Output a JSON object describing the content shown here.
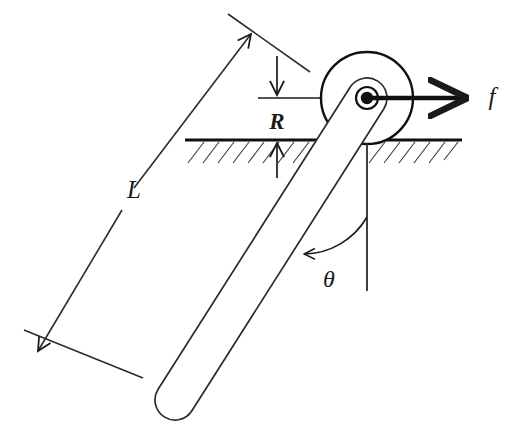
{
  "figure": {
    "background_color": "#ffffff",
    "stroke_color": "#1a1a1a",
    "width": 529,
    "height": 437
  },
  "labels": {
    "length": "L",
    "radius": "R",
    "force": "f",
    "angle": "θ"
  },
  "elements": {
    "wheel": {
      "name": "wheel-circle",
      "cx": 367,
      "cy": 98,
      "r": 46
    },
    "hub_outer": {
      "name": "hub-outer-ring",
      "cx": 367,
      "cy": 98,
      "r": 11
    },
    "hub_inner": {
      "name": "hub-center-dot",
      "cx": 367,
      "cy": 98,
      "r": 6
    },
    "rod": {
      "name": "inclined-rod",
      "top_x": 367,
      "top_y": 98,
      "bottom_x": 175,
      "bottom_y": 400,
      "half_width": 20
    },
    "ground": {
      "name": "ground-line",
      "x1": 185,
      "x2": 462,
      "y": 140
    },
    "centerline": {
      "name": "wheel-centerline",
      "x1": 258,
      "x2": 432,
      "y": 98
    },
    "force_arrow": {
      "name": "force-arrow",
      "x1": 367,
      "x2": 480,
      "y": 98
    },
    "vertical_ref": {
      "name": "vertical-reference-line",
      "x": 367,
      "y1": 143,
      "y2": 291
    },
    "angle_arc": {
      "name": "angle-arc",
      "cx": 367,
      "cy": 291,
      "radius": 74,
      "from_deg": 270,
      "to_deg": 212
    },
    "dimension_L": {
      "name": "length-dimension-line",
      "x1": 248,
      "y1": 32,
      "x2": 40,
      "y2": 353,
      "label_x": 134,
      "label_y": 194
    },
    "dimension_R": {
      "name": "radius-dimension",
      "x": 277,
      "top_y": 58,
      "mid_y": 98,
      "bottom_y": 140,
      "bottom_end_y": 175,
      "label_x": 277,
      "label_y": 128
    }
  },
  "annotations": {
    "L_description": "Rod length dimension with arrows at both ends",
    "R_description": "Wheel radius dimension between centerline and ground",
    "f_description": "Horizontal applied force at the hub",
    "theta_description": "Angle between rod and vertical reference"
  }
}
